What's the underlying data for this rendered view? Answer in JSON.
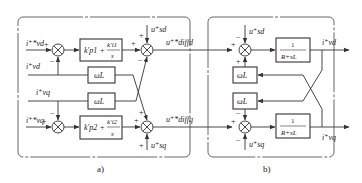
{
  "panels": {
    "a": {
      "caption": "a)",
      "inputs": {
        "i_vd_ref": "i⁺*vd",
        "i_vd_fb": "i⁺vd",
        "i_vq_fb": "i⁺vq",
        "i_vq_ref": "i⁺*vq"
      },
      "blocks": {
        "pi1": {
          "kp": "k′p1",
          "ki": "k′i1",
          "den": "s"
        },
        "pi2": {
          "kp": "k′p2",
          "ki": "k′i2",
          "den": "s"
        },
        "wl_top": "ωL",
        "wl_bot": "ωL"
      },
      "feedforward": {
        "u_sd": "u⁺sd",
        "u_sq": "u⁺sq"
      },
      "outputs": {
        "u_diffd": "u⁺*diffd",
        "u_diffq": "u⁺*diffq"
      }
    },
    "b": {
      "caption": "b)",
      "blocks": {
        "plant_d": {
          "num": "1",
          "den": "R+sL"
        },
        "plant_q": {
          "num": "1",
          "den": "R+sL"
        },
        "wl_top": "ωL",
        "wl_bot": "ωL"
      },
      "disturbances": {
        "u_sd": "u⁺sd",
        "u_sq": "u⁺sq"
      },
      "outputs": {
        "i_vd": "i⁺vd",
        "i_vq": "i⁺vq"
      }
    }
  },
  "signs": {
    "plus": "+",
    "minus": "−"
  },
  "colors": {
    "line": "#333333",
    "frame": "#555555",
    "text": "#222222"
  }
}
